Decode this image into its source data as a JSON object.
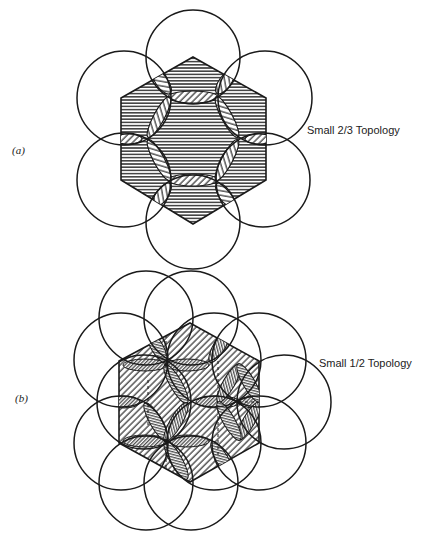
{
  "figure": {
    "panels": [
      {
        "id": "a",
        "panel_label": "(a)",
        "caption": "Small 2/3 Topology",
        "hexagon_fill": "horizontal-hatch",
        "overlap_fill": "diagonal-hatch",
        "circle_count": 6
      },
      {
        "id": "b",
        "panel_label": "(b)",
        "caption": "Small 1/2 Topology",
        "hexagon_fill": "diagonal-hatch",
        "overlap_fill": "dense-diagonal-hatch",
        "circle_count": 12
      }
    ],
    "colors": {
      "stroke": "#1a1a1a",
      "background": "#ffffff"
    }
  }
}
